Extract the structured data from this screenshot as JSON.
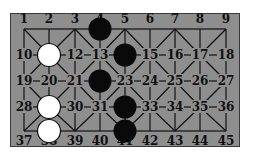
{
  "board": {
    "columns": 9,
    "rows": 5,
    "labels": [
      "1",
      "2",
      "3",
      "4",
      "5",
      "6",
      "7",
      "8",
      "9",
      "10",
      "11",
      "12",
      "13",
      "14",
      "15",
      "16",
      "17",
      "18",
      "19",
      "20",
      "21",
      "22",
      "23",
      "24",
      "25",
      "26",
      "27",
      "28",
      "29",
      "30",
      "31",
      "32",
      "33",
      "34",
      "35",
      "36",
      "37",
      "38",
      "39",
      "40",
      "41",
      "42",
      "43",
      "44",
      "45"
    ],
    "black_pieces": [
      4,
      14,
      22,
      32,
      41
    ],
    "white_pieces": [
      11,
      29,
      38
    ],
    "colors": {
      "background": "#8e8e8e",
      "lines": "#111111",
      "black_piece": "#0a0a0a",
      "white_piece": "#ffffff"
    }
  }
}
